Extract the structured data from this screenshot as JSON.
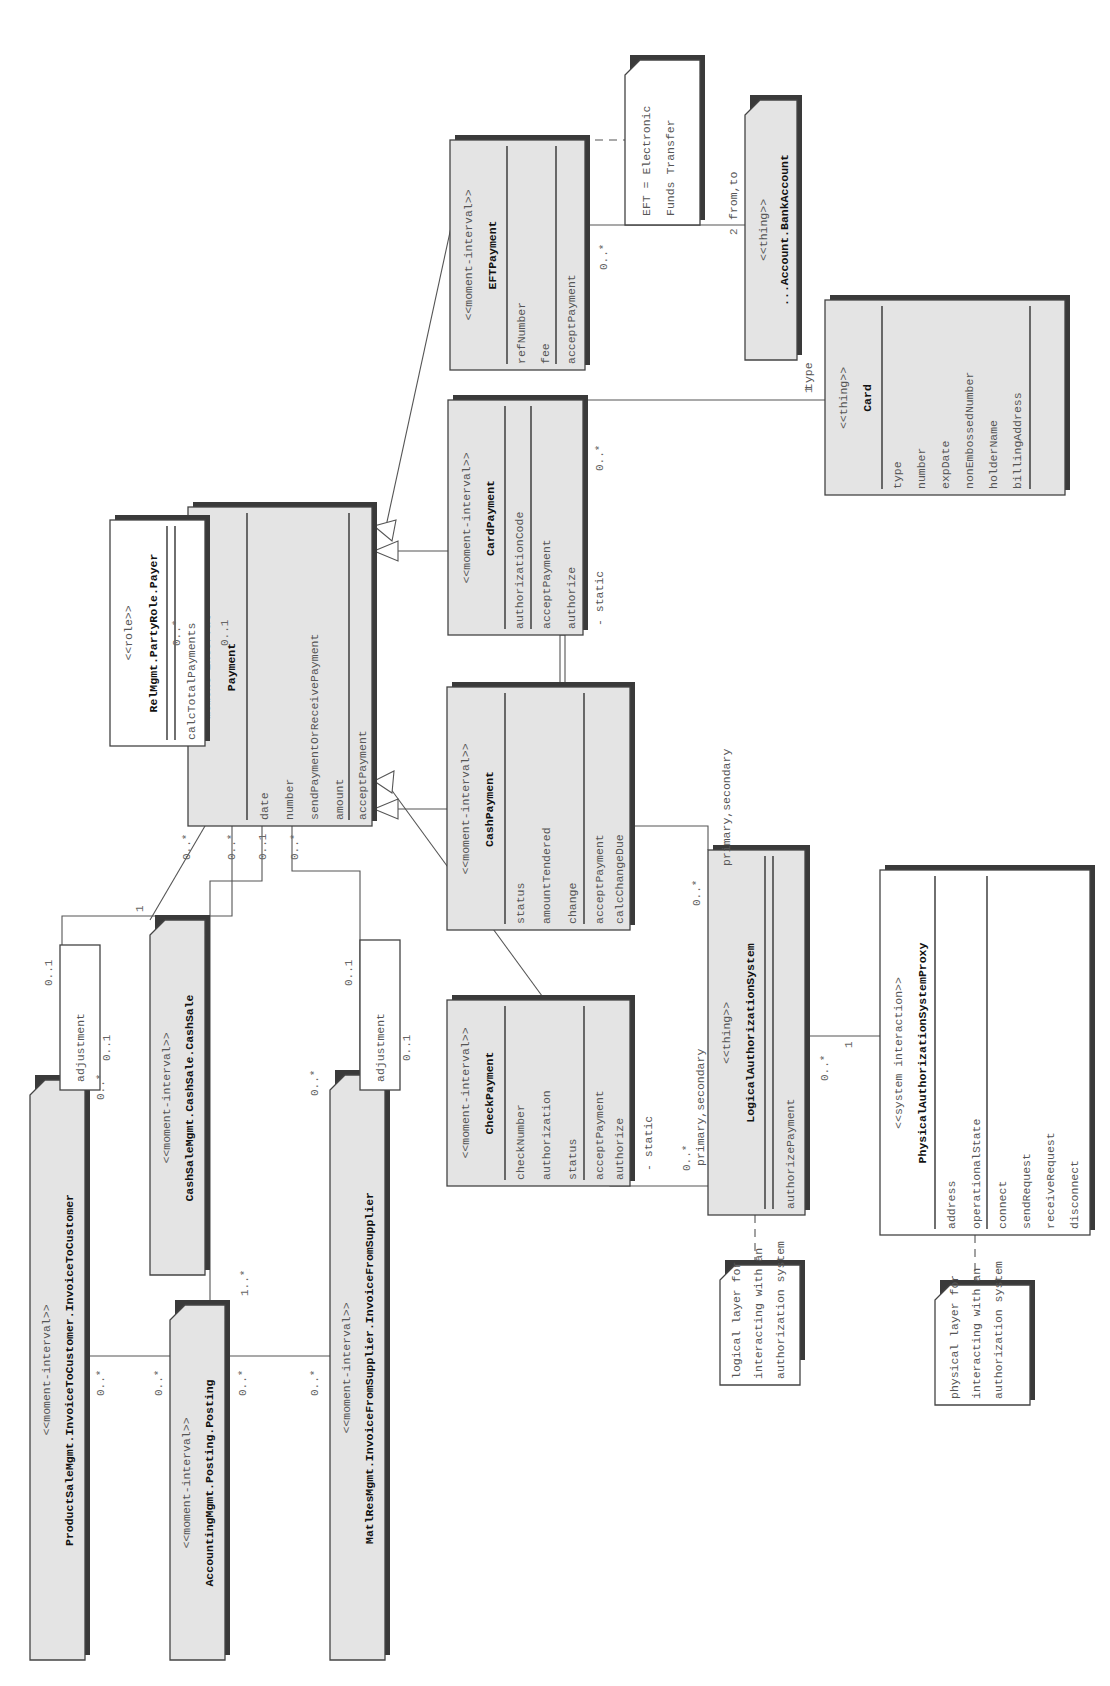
{
  "diagram": {
    "orientation": "rotated 90 degrees counter-clockwise",
    "classes": {
      "payment": {
        "stereotype": "<<moment-interval>>",
        "name": "Payment",
        "attributes": [
          "date",
          "number",
          "sendPaymentOrReceivePayment",
          "amount"
        ],
        "methods": [
          "acceptPayment"
        ]
      },
      "payer": {
        "stereotype": "<<role>>",
        "name": "RelMgmt.PartyRole.Payer",
        "attributes": [],
        "methods": [
          "calcTotalPayments"
        ]
      },
      "check_payment": {
        "stereotype": "<<moment-interval>>",
        "name": "CheckPayment",
        "attributes": [
          "checkNumber",
          "authorization",
          "status"
        ],
        "methods": [
          "acceptPayment",
          "authorize"
        ]
      },
      "cash_payment": {
        "stereotype": "<<moment-interval>>",
        "name": "CashPayment",
        "attributes": [
          "status",
          "amountTendered",
          "change"
        ],
        "methods": [
          "acceptPayment",
          "calcChangeDue"
        ]
      },
      "card_payment": {
        "stereotype": "<<moment-interval>>",
        "name": "CardPayment",
        "attributes": [
          "authorizationCode"
        ],
        "methods": [
          "acceptPayment",
          "authorize"
        ]
      },
      "eft_payment": {
        "stereotype": "<<moment-interval>>",
        "name": "EFTPayment",
        "attributes": [
          "refNumber",
          "fee"
        ],
        "methods": [
          "acceptPayment"
        ]
      },
      "bank_account": {
        "stereotype": "<<thing>>",
        "name": "...Account.BankAccount"
      },
      "card": {
        "stereotype": "<<thing>>",
        "name": "Card",
        "attributes": [
          "type",
          "number",
          "expDate",
          "nonEmbossedNumber",
          "holderName",
          "billingAddress"
        ],
        "methods": []
      },
      "logical_auth": {
        "stereotype": "<<thing>>",
        "name": "LogicalAuthorizationSystem",
        "attributes": [],
        "methods": [
          "authorizePayment"
        ]
      },
      "physical_auth": {
        "stereotype": "<<system interaction>>",
        "name": "PhysicalAuthorizationSystemProxy",
        "attributes": [
          "address",
          "operationalState"
        ],
        "methods": [
          "connect",
          "sendRequest",
          "receiveRequest",
          "disconnect"
        ]
      },
      "invoice_to_customer": {
        "stereotype": "<<moment-interval>>",
        "name": "ProductSaleMgmt.InvoiceToCustomer.InvoiceToCustomer"
      },
      "cash_sale": {
        "stereotype": "<<moment-interval>>",
        "name": "CashSaleMgmt.CashSale.CashSale"
      },
      "posting": {
        "stereotype": "<<moment-interval>>",
        "name": "AccountingMgmt.Posting.Posting"
      },
      "invoice_from_supplier": {
        "stereotype": "<<moment-interval>>",
        "name": "MatlResMgmt.InvoiceFromSupplier.InvoiceFromSupplier"
      }
    },
    "notes": {
      "eft": [
        "EFT = Electronic",
        "Funds Transfer"
      ],
      "logical": [
        "logical layer for",
        "interacting with an",
        "authorization system"
      ],
      "physical": [
        "physical layer for",
        "interacting with an",
        "authorization system"
      ]
    },
    "qualifiers": {
      "adjustment_customer": "adjustment",
      "adjustment_supplier": "adjustment"
    },
    "labels": {
      "payer_mult": "0..1",
      "payment_payer_mult": "0..*",
      "cashsale_mult": "1",
      "payment_cashsale_mult": "0..*",
      "payment_invcust_mult": "0..*",
      "payment_posting_mult": "0..1",
      "payment_invsupp_mult": "0..*",
      "invcust_payment_mult": "0..*",
      "posting_payment_mult": "1..*",
      "invsupp_payment_mult": "0..*",
      "adj_cust_top": "0..1",
      "adj_cust_bottom": "0..1",
      "adj_supp_top": "0..1",
      "adj_supp_bottom": "0..1",
      "invcust_posting_a": "0..*",
      "invcust_posting_b": "0..*",
      "posting_invsupp_a": "0..*",
      "posting_invsupp_b": "0..*",
      "check_static": "- static",
      "check_logical_mult": "0..*",
      "check_primary": "primary,secondary",
      "card_static": "- static",
      "card_card_mult": "0..*",
      "card_logical_mult": "0..*",
      "card_primary": "primary,secondary",
      "card_one": "1",
      "card_type": "type",
      "eft_account_mult": "0..*",
      "account_two": "2",
      "account_fromto": "from,to",
      "logical_physical_mult": "0..*",
      "physical_one": "1"
    }
  }
}
